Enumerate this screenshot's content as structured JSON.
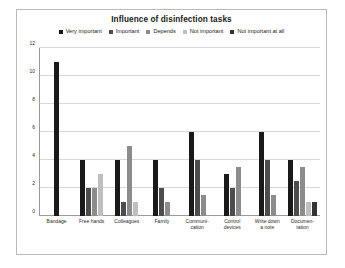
{
  "chart_data": {
    "type": "bar",
    "title": "Influence of disinfection tasks",
    "xlabel": "",
    "ylabel": "",
    "ylim": [
      0,
      12
    ],
    "yticks": [
      0,
      2,
      4,
      6,
      8,
      10,
      12
    ],
    "grid": true,
    "legend_position": "top",
    "categories": [
      "Bandage",
      "Free hands",
      "Colleagues",
      "Family",
      "Communi-\ncation",
      "Control\ndevices",
      "Write down\na note",
      "Documen-\ntation"
    ],
    "series": [
      {
        "name": "Very important",
        "color": "#1a1a1a",
        "values": [
          11,
          4,
          4,
          4,
          6,
          3,
          6,
          4
        ]
      },
      {
        "name": "Important",
        "color": "#4d4d4d",
        "values": [
          0,
          2,
          1,
          2,
          4,
          2,
          4,
          2.5
        ]
      },
      {
        "name": "Depends",
        "color": "#8c8c8c",
        "values": [
          0,
          2,
          5,
          1,
          1.5,
          3.5,
          1.5,
          3.5
        ]
      },
      {
        "name": "Not important",
        "color": "#bfbfbf",
        "values": [
          0,
          3,
          1,
          0,
          0,
          0,
          0,
          1
        ]
      },
      {
        "name": "Not important at all",
        "color": "#333333",
        "values": [
          0,
          0,
          0,
          0,
          0,
          0,
          0,
          1
        ]
      }
    ]
  }
}
